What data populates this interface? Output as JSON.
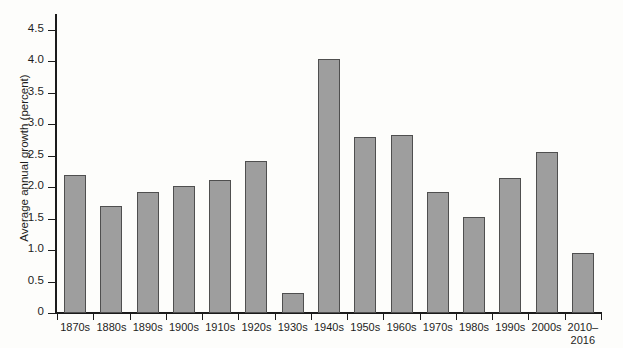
{
  "chart_data": {
    "type": "bar",
    "title": "",
    "subtitle": "",
    "xlabel": "",
    "ylabel": "Average annual growth (percent)",
    "categories": [
      "1870s",
      "1880s",
      "1890s",
      "1900s",
      "1910s",
      "1920s",
      "1930s",
      "1940s",
      "1950s",
      "1960s",
      "1970s",
      "1980s",
      "1990s",
      "2000s",
      "2010–\n2016"
    ],
    "values": [
      2.2,
      1.7,
      1.93,
      2.02,
      2.12,
      2.42,
      0.32,
      4.03,
      2.8,
      2.83,
      1.93,
      1.53,
      2.15,
      2.55,
      0.95
    ],
    "ylim": [
      0,
      4.75
    ],
    "ytick_values": [
      0,
      0.5,
      1.0,
      1.5,
      2.0,
      2.5,
      3.0,
      3.5,
      4.0,
      4.5
    ],
    "ytick_labels": [
      "0",
      "0.5",
      "1.0",
      "1.5",
      "2.0",
      "2.5",
      "3.0",
      "3.5",
      "4.0",
      "4.5"
    ],
    "grid": false,
    "legend": null,
    "legend_position": "none",
    "bar_color": "#9e9e9e",
    "bar_edge_color": "#4f4f4f",
    "axis_color": "#1b1b1b",
    "background_color": "#fdfdfb"
  }
}
